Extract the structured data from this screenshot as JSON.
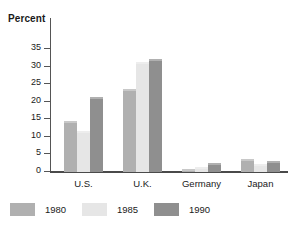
{
  "chart_data": {
    "type": "bar",
    "title": "",
    "subtitle": "",
    "xlabel": "",
    "ylabel": "Percent",
    "ylim": [
      0,
      37
    ],
    "yticks": [
      0,
      5,
      10,
      15,
      20,
      25,
      30,
      35
    ],
    "ytick_labels": [
      "0",
      "5",
      "10",
      "15",
      "20",
      "25",
      "30",
      "35"
    ],
    "grid": false,
    "legend_position": "bottom-left",
    "categories": [
      "U.S.",
      "U.K.",
      "Germany",
      "Japan"
    ],
    "series": [
      {
        "name": "1980",
        "color": "#b0b0b0",
        "values": [
          14.5,
          23.7,
          0.8,
          3.7
        ]
      },
      {
        "name": "1985",
        "color": "#e6e6e6",
        "values": [
          11.6,
          31.3,
          1.3,
          2.2
        ]
      },
      {
        "name": "1990",
        "color": "#8f8f8f",
        "values": [
          21.3,
          32.1,
          2.6,
          3.0
        ]
      }
    ]
  },
  "axis": {
    "title": "Percent"
  },
  "colors": {
    "axis": "#4a4a4a",
    "text": "#1a1a1a",
    "background": "#ffffff"
  }
}
